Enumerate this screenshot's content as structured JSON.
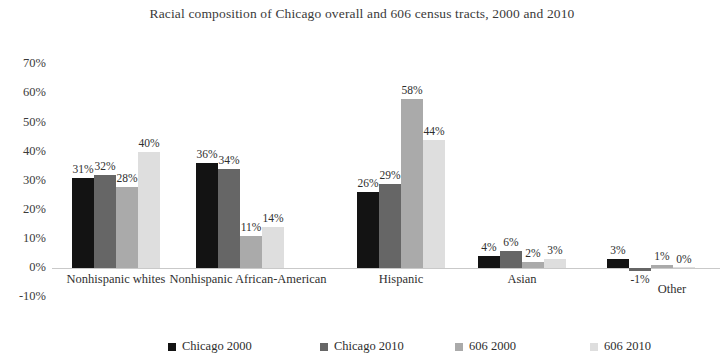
{
  "chart_data": {
    "type": "bar",
    "title": "Racial composition of Chicago overall and 606 census tracts, 2000 and 2010",
    "xlabel": "",
    "ylabel": "",
    "ylim": [
      -10,
      70
    ],
    "ytick_labels": [
      "70%",
      "60%",
      "50%",
      "40%",
      "30%",
      "20%",
      "10%",
      "0%",
      "-10%"
    ],
    "ytick_values": [
      70,
      60,
      50,
      40,
      30,
      20,
      10,
      0,
      -10
    ],
    "grid": false,
    "legend_position": "bottom",
    "categories": [
      "Nonhispanic whites",
      "Nonhispanic African-American",
      "Hispanic",
      "Asian",
      "Other"
    ],
    "series": [
      {
        "name": "Chicago 2000",
        "color": "#131313",
        "values": [
          31,
          36,
          26,
          4,
          3
        ],
        "labels": [
          "31%",
          "36%",
          "26%",
          "4%",
          "3%"
        ]
      },
      {
        "name": "Chicago 2010",
        "color": "#666666",
        "values": [
          32,
          34,
          29,
          6,
          -1
        ],
        "labels": [
          "32%",
          "34%",
          "29%",
          "6%",
          "-1%"
        ]
      },
      {
        "name": "606 2000",
        "color": "#aaaaaa",
        "values": [
          28,
          11,
          58,
          2,
          1
        ],
        "labels": [
          "28%",
          "11%",
          "58%",
          "2%",
          "1%"
        ]
      },
      {
        "name": "606 2010",
        "color": "#dedede",
        "values": [
          40,
          14,
          44,
          3,
          0
        ],
        "labels": [
          "40%",
          "14%",
          "44%",
          "3%",
          "0%"
        ]
      }
    ]
  },
  "axis": {
    "zero_line_color": "#c9c9c9"
  }
}
